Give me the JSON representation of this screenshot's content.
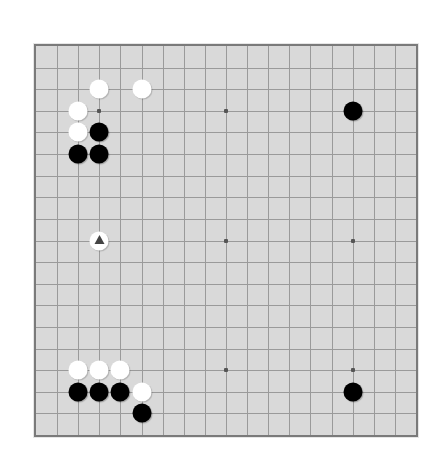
{
  "board": {
    "size": 19,
    "colors": {
      "background": "#d9d9d9",
      "border": "#7a7a7a",
      "grid": "#9a9a9a",
      "black_stone": "#000000",
      "white_stone": "#ffffff",
      "marker": "#444444"
    },
    "hoshi": [
      [
        3,
        3
      ],
      [
        9,
        3
      ],
      [
        15,
        3
      ],
      [
        3,
        9
      ],
      [
        9,
        9
      ],
      [
        15,
        9
      ],
      [
        3,
        15
      ],
      [
        9,
        15
      ],
      [
        15,
        15
      ]
    ],
    "stones": [
      {
        "color": "white",
        "col": 3,
        "row": 2
      },
      {
        "color": "white",
        "col": 5,
        "row": 2
      },
      {
        "color": "white",
        "col": 2,
        "row": 3
      },
      {
        "color": "white",
        "col": 2,
        "row": 4
      },
      {
        "color": "black",
        "col": 3,
        "row": 4
      },
      {
        "color": "black",
        "col": 2,
        "row": 5
      },
      {
        "color": "black",
        "col": 3,
        "row": 5
      },
      {
        "color": "black",
        "col": 15,
        "row": 3
      },
      {
        "color": "white",
        "col": 3,
        "row": 9,
        "marker": "triangle"
      },
      {
        "color": "white",
        "col": 2,
        "row": 15
      },
      {
        "color": "white",
        "col": 3,
        "row": 15
      },
      {
        "color": "white",
        "col": 4,
        "row": 15
      },
      {
        "color": "black",
        "col": 2,
        "row": 16
      },
      {
        "color": "black",
        "col": 3,
        "row": 16
      },
      {
        "color": "black",
        "col": 4,
        "row": 16
      },
      {
        "color": "white",
        "col": 5,
        "row": 16
      },
      {
        "color": "black",
        "col": 5,
        "row": 17
      },
      {
        "color": "black",
        "col": 15,
        "row": 16
      }
    ]
  }
}
